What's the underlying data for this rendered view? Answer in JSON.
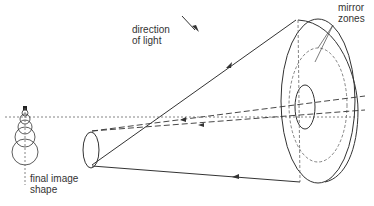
{
  "labels": {
    "direction_line1": "direction",
    "direction_line2": "of light",
    "mirror_line1": "mirror",
    "mirror_line2": "zones",
    "final_line1": "final image",
    "final_line2": "shape"
  },
  "colors": {
    "stroke": "#333333",
    "dashed": "#555555",
    "background": "#ffffff"
  }
}
